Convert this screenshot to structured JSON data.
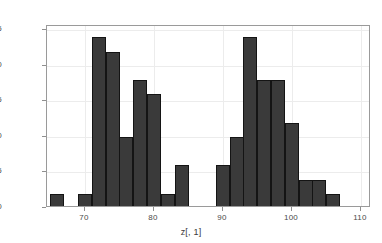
{
  "chart_data": {
    "type": "bar",
    "subtype": "histogram",
    "title": "",
    "xlabel": "z[, 1]",
    "ylabel": "",
    "xlim": [
      64.5,
      111.5
    ],
    "ylim": [
      0,
      12.8
    ],
    "bin_width": 2,
    "bin_starts": [
      65,
      67,
      69,
      71,
      73,
      75,
      77,
      79,
      81,
      83,
      85,
      87,
      89,
      91,
      93,
      95,
      97,
      99,
      101,
      103,
      105,
      107,
      109
    ],
    "categories": [
      "65-67",
      "67-69",
      "69-71",
      "71-73",
      "73-75",
      "75-77",
      "77-79",
      "79-81",
      "81-83",
      "83-85",
      "85-87",
      "87-89",
      "89-91",
      "91-93",
      "93-95",
      "95-97",
      "97-99",
      "99-101",
      "101-103",
      "103-105",
      "105-107",
      "107-109",
      "109-111"
    ],
    "values": [
      1,
      0,
      1,
      12,
      11,
      5,
      9,
      8,
      1,
      3,
      0,
      0,
      3,
      5,
      12,
      9,
      9,
      6,
      2,
      2,
      1,
      0,
      0
    ],
    "x_ticks": [
      70,
      80,
      90,
      100,
      110
    ],
    "x_tick_labels": [
      "70",
      "80",
      "90",
      "100",
      "110"
    ],
    "y_ticks": [
      0.0,
      2.5,
      5.0,
      7.5,
      10.0,
      12.5
    ],
    "y_tick_labels": [
      "0.0",
      "2.5",
      "5.0",
      "7.5",
      "10.0",
      "12.5"
    ],
    "grid": true,
    "legend": "none",
    "bar_color": "#3a3a3a",
    "bar_edge_color": "#141414",
    "frame_color": "#9a9a9a",
    "grid_color": "#ececec",
    "background": "#ffffff"
  }
}
